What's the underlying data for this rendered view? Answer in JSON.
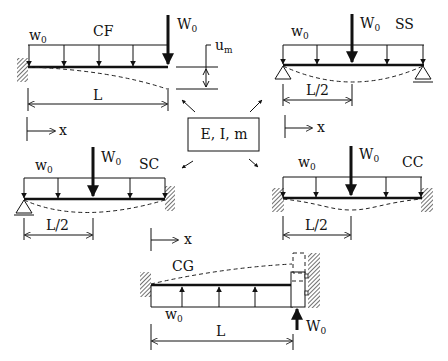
{
  "center_box": {
    "label": "E, I, m"
  },
  "cases": {
    "cf": {
      "name": "CF",
      "dist_load": "w",
      "dist_load_sub": "0",
      "point_load": "W",
      "point_load_sub": "0",
      "dimension": "L",
      "coord": "x",
      "deflection": "u",
      "deflection_sub": "m"
    },
    "ss": {
      "name": "SS",
      "dist_load": "w",
      "dist_load_sub": "0",
      "point_load": "W",
      "point_load_sub": "0",
      "dimension": "L/2",
      "coord": "x"
    },
    "sc": {
      "name": "SC",
      "dist_load": "w",
      "dist_load_sub": "0",
      "point_load": "W",
      "point_load_sub": "0",
      "dimension": "L/2",
      "coord": "x"
    },
    "cc": {
      "name": "CC",
      "dist_load": "w",
      "dist_load_sub": "0",
      "point_load": "W",
      "point_load_sub": "0",
      "dimension": "L/2"
    },
    "cg": {
      "name": "CG",
      "dist_load": "w",
      "dist_load_sub": "0",
      "point_load": "W",
      "point_load_sub": "0",
      "dimension": "L"
    }
  },
  "colors": {
    "ink": "#111111",
    "background": "#ffffff"
  }
}
